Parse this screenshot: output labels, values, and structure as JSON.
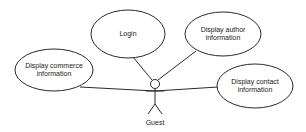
{
  "diagram": {
    "type": "use-case",
    "actor": {
      "label": "Guest"
    },
    "use_cases": [
      {
        "id": "login",
        "lines": [
          "Login"
        ]
      },
      {
        "id": "author",
        "lines": [
          "Display author",
          "information"
        ]
      },
      {
        "id": "commerce",
        "lines": [
          "Display commerce",
          "information"
        ]
      },
      {
        "id": "contact",
        "lines": [
          "Display contact",
          "information"
        ]
      }
    ],
    "associations": [
      {
        "from": "Guest",
        "to": "Login"
      },
      {
        "from": "Guest",
        "to": "Display author information"
      },
      {
        "from": "Guest",
        "to": "Display commerce information"
      },
      {
        "from": "Guest",
        "to": "Display contact information"
      }
    ],
    "colors": {
      "stroke": "#2a2a2a",
      "fill": "#ffffff",
      "text": "#1a1a1a"
    }
  }
}
